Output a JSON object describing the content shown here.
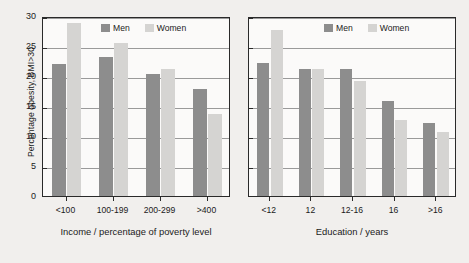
{
  "chart_data": {
    "type": "bar",
    "title": "",
    "ylabel": "Percentage obesity, BMI>30",
    "ylim": [
      0,
      30
    ],
    "yticks": [
      0,
      5,
      10,
      15,
      20,
      25,
      30
    ],
    "grid": true,
    "legend": {
      "position": "top-center",
      "entries": [
        {
          "name": "Men",
          "color": "#8d8d8d"
        },
        {
          "name": "Women",
          "color": "#d5d4d2"
        }
      ]
    },
    "panels": [
      {
        "id": "income",
        "xlabel": "Income / percentage of poverty level",
        "categories": [
          "<100",
          "100-199",
          "200-299",
          ">400"
        ],
        "series": [
          {
            "name": "Men",
            "color": "#8d8d8d",
            "values": [
              22.0,
              23.1,
              20.4,
              17.9
            ]
          },
          {
            "name": "Women",
            "color": "#d5d4d2",
            "values": [
              28.8,
              25.5,
              21.1,
              13.7
            ]
          }
        ]
      },
      {
        "id": "education",
        "xlabel": "Education / years",
        "categories": [
          "<12",
          "12",
          "12-16",
          "16",
          ">16"
        ],
        "series": [
          {
            "name": "Men",
            "color": "#8d8d8d",
            "values": [
              22.2,
              21.2,
              21.2,
              15.9,
              12.1
            ]
          },
          {
            "name": "Women",
            "color": "#d5d4d2",
            "values": [
              27.7,
              21.1,
              19.1,
              12.7,
              10.7
            ]
          }
        ]
      }
    ]
  },
  "legend_income": {
    "men": "Men",
    "women": "Women"
  },
  "legend_education": {
    "men": "Men",
    "women": "Women"
  },
  "axis": {
    "ylabel": "Percentage obesity, BMI>30",
    "xlabel_income": "Income / percentage of poverty level",
    "xlabel_education": "Education / years",
    "yticks": [
      "0",
      "5",
      "10",
      "15",
      "20",
      "25",
      "30"
    ]
  },
  "colors": {
    "men": "#8d8d8d",
    "women": "#d5d4d2",
    "axis": "#2a2a2a",
    "grid": "#9a9a9a",
    "background": "#f1efed"
  }
}
